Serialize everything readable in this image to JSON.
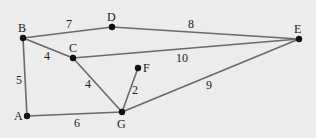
{
  "graph": {
    "background": "#ececec",
    "nodes": [
      {
        "id": "A",
        "label": "A",
        "x": 27,
        "y": 116,
        "lx": 14,
        "ly": 120
      },
      {
        "id": "B",
        "label": "B",
        "x": 23,
        "y": 38,
        "lx": 18,
        "ly": 32
      },
      {
        "id": "C",
        "label": "C",
        "x": 73,
        "y": 58,
        "lx": 69,
        "ly": 52
      },
      {
        "id": "D",
        "label": "D",
        "x": 112,
        "y": 27,
        "lx": 107,
        "ly": 21
      },
      {
        "id": "E",
        "label": "E",
        "x": 299,
        "y": 39,
        "lx": 294,
        "ly": 33
      },
      {
        "id": "F",
        "label": "F",
        "x": 138,
        "y": 68,
        "lx": 143,
        "ly": 72
      },
      {
        "id": "G",
        "label": "G",
        "x": 122,
        "y": 112,
        "lx": 117,
        "ly": 128
      }
    ],
    "edges": [
      {
        "from": "B",
        "to": "D",
        "weight": "7",
        "lx": 66,
        "ly": 28
      },
      {
        "from": "D",
        "to": "E",
        "weight": "8",
        "lx": 188,
        "ly": 28
      },
      {
        "from": "B",
        "to": "C",
        "weight": "4",
        "lx": 44,
        "ly": 60
      },
      {
        "from": "C",
        "to": "E",
        "weight": "10",
        "lx": 176,
        "ly": 62
      },
      {
        "from": "B",
        "to": "A",
        "weight": "5",
        "lx": 16,
        "ly": 84
      },
      {
        "from": "C",
        "to": "G",
        "weight": "4",
        "lx": 85,
        "ly": 88
      },
      {
        "from": "F",
        "to": "G",
        "weight": "2",
        "lx": 132,
        "ly": 94
      },
      {
        "from": "G",
        "to": "E",
        "weight": "9",
        "lx": 206,
        "ly": 89
      },
      {
        "from": "A",
        "to": "G",
        "weight": "6",
        "lx": 74,
        "ly": 127
      }
    ]
  }
}
